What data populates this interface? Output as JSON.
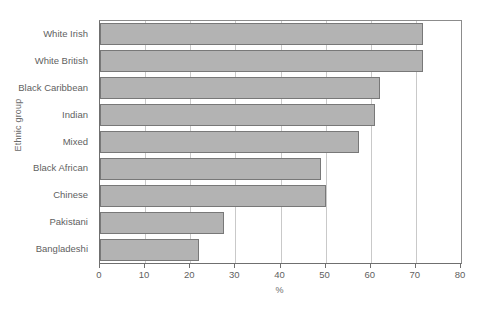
{
  "chart_data": {
    "type": "bar",
    "orientation": "horizontal",
    "title": "",
    "xlabel": "%",
    "ylabel": "Ethnic group",
    "categories": [
      "White Irish",
      "White British",
      "Black Caribbean",
      "Indian",
      "Mixed",
      "Black African",
      "Chinese",
      "Pakistani",
      "Bangladeshi"
    ],
    "values": [
      71.5,
      71.5,
      62.0,
      61.0,
      57.5,
      49.0,
      50.0,
      27.5,
      22.0
    ],
    "xlim": [
      0,
      80
    ],
    "xticks": [
      0,
      10,
      20,
      30,
      40,
      50,
      60,
      70,
      80
    ],
    "xtick_labels": [
      "0",
      "10",
      "20",
      "30",
      "40",
      "50",
      "60",
      "70",
      "80"
    ],
    "grid": "vertical",
    "legend": "none",
    "bar_color": "#b3b3b3",
    "bar_border_color": "#787878",
    "axis_color": "#6f6f6f",
    "grid_color": "#c9c9c9"
  }
}
